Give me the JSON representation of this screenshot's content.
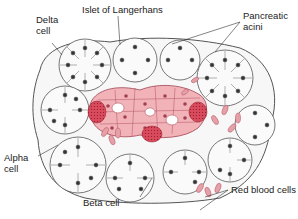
{
  "figure": {
    "labels": {
      "delta_cell": [
        "Delta",
        "cell"
      ],
      "islet": "Islet of Langerhans",
      "acini": [
        "Pancreatic",
        "acini"
      ],
      "alpha_cell": [
        "Alpha",
        "cell"
      ],
      "beta_cell": "Beta cell",
      "rbc": "Red blood cells"
    },
    "colors": {
      "islet_fill": "#f2b3b8",
      "alpha_granular": "#d94a5c",
      "rbc": "#e6a0a8",
      "acinar_outline": "#555555",
      "nucleus": "#333333"
    }
  }
}
